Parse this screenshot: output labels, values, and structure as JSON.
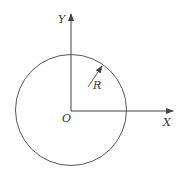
{
  "diagram": {
    "axes": {
      "x_label": "X",
      "y_label": "Y",
      "origin_label": "O"
    },
    "circle": {
      "radius_label": "R"
    },
    "colors": {
      "stroke": "#444444",
      "text": "#333333",
      "background": "#ffffff"
    }
  }
}
